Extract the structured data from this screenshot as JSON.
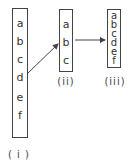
{
  "diagram": {
    "boxes": [
      {
        "id": "i",
        "label": "( i )",
        "letters": [
          "a",
          "b",
          "c",
          "d",
          "e",
          "f"
        ]
      },
      {
        "id": "ii",
        "label": "(ii)",
        "letters": [
          "a",
          "b",
          "c"
        ]
      },
      {
        "id": "iii",
        "label": "(iii)",
        "letters": [
          "a",
          "b",
          "c",
          "d",
          "e",
          "f"
        ]
      }
    ],
    "arrows": [
      {
        "from": "i (between c and d)",
        "to": "ii (b)"
      },
      {
        "from": "ii (b)",
        "to": "iii (c)"
      }
    ],
    "colors": {
      "stroke": "#444444",
      "text": "#333333"
    }
  }
}
